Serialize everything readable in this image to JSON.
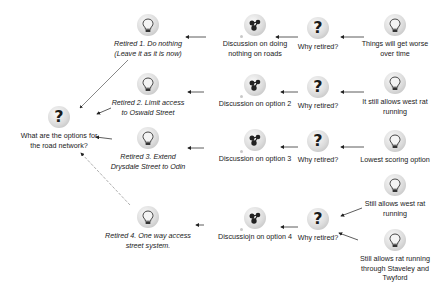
{
  "root": {
    "label_line1": "What are the options for",
    "label_line2": "the road network?",
    "icon": "question-icon"
  },
  "rows": [
    {
      "retired": {
        "line1": "Retired 1. Do nothing",
        "line2": "(Leave it as it is now)",
        "icon": "lightbulb-icon"
      },
      "discussion": {
        "line1": "Discussion on doing",
        "line2": "nothing on roads",
        "icon": "map-icon"
      },
      "why": {
        "label": "Why retired?",
        "icon": "question-icon"
      },
      "reasons": [
        {
          "line1": "Things will get worse",
          "line2": "over time",
          "line3": "",
          "icon": "lightbulb-icon"
        }
      ]
    },
    {
      "retired": {
        "line1": "Retired 2. Limit access",
        "line2": "to Oswald Street",
        "icon": "lightbulb-icon"
      },
      "discussion": {
        "line1": "Discussion on option 2",
        "line2": "",
        "icon": "map-icon"
      },
      "why": {
        "label": "Why retired?",
        "icon": "question-icon"
      },
      "reasons": [
        {
          "line1": "It still allows west rat",
          "line2": "running",
          "line3": "",
          "icon": "lightbulb-icon"
        }
      ]
    },
    {
      "retired": {
        "line1": "Retired 3. Extend",
        "line2": "Drysdale Street to Odin",
        "icon": "lightbulb-icon"
      },
      "discussion": {
        "line1": "Discussion on option 3",
        "line2": "",
        "icon": "map-icon"
      },
      "why": {
        "label": "Why retired?",
        "icon": "question-icon"
      },
      "reasons": [
        {
          "line1": "Lowest scoring option",
          "line2": "",
          "line3": "",
          "icon": "lightbulb-icon"
        }
      ]
    },
    {
      "retired": {
        "line1": "Retired 4. One way access",
        "line2": "street system.",
        "icon": "lightbulb-icon"
      },
      "discussion": {
        "line1": "Discussiojn on option 4",
        "line2": "",
        "icon": "map-icon"
      },
      "why": {
        "label": "Why retired?",
        "icon": "question-icon"
      },
      "reasons": [
        {
          "line1": "Still allows west rat",
          "line2": "running",
          "line3": "",
          "icon": "lightbulb-icon"
        },
        {
          "line1": "Still allows rat running",
          "line2": "through Staveley and",
          "line3": "Twyford",
          "icon": "lightbulb-icon"
        }
      ]
    }
  ],
  "colors": {
    "edge": "#333333",
    "edge_dashed": "#9a9a9a",
    "icon_bg": "#d6d6d6"
  }
}
